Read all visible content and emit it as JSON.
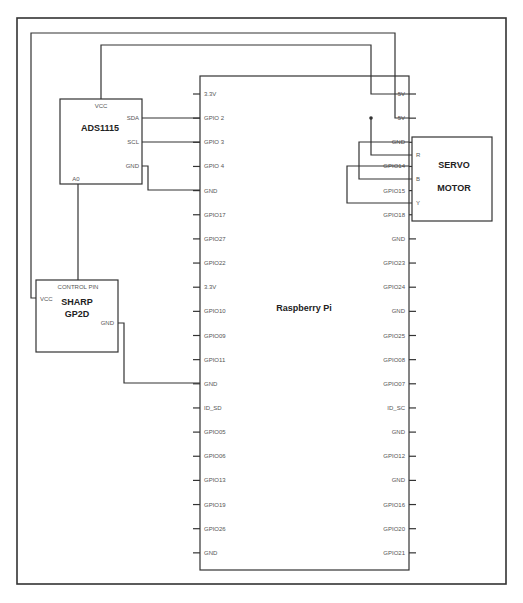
{
  "diagram": {
    "type": "wiring-schematic",
    "components": {
      "ads1115": {
        "title": "ADS1115",
        "pins": {
          "vcc": "VCC",
          "sda": "SDA",
          "scl": "SCL",
          "gnd": "GND",
          "a0": "A0"
        }
      },
      "sharp": {
        "title_line1": "SHARP",
        "title_line2": "GP2D",
        "pins": {
          "control": "CONTROL PIN",
          "vcc": "VCC",
          "gnd": "GND"
        }
      },
      "rpi": {
        "title": "Raspberry Pi",
        "left_pins": [
          "3.3V",
          "GPIO 2",
          "GPIO 3",
          "GPIO 4",
          "GND",
          "GPIO17",
          "GPIO27",
          "GPIO22",
          "3.3V",
          "GPIO10",
          "GPIO09",
          "GPIO11",
          "GND",
          "ID_SD",
          "GPIO05",
          "GPIO06",
          "GPIO13",
          "GPIO19",
          "GPIO26",
          "GND"
        ],
        "right_pins": [
          "5V",
          "5V",
          "GND",
          "GPIO14",
          "GPIO15",
          "GPIO18",
          "GND",
          "GPIO23",
          "GPIO24",
          "GND",
          "GPIO25",
          "GPIO08",
          "GPIO07",
          "ID_SC",
          "GND",
          "GPIO12",
          "GND",
          "GPIO16",
          "GPIO20",
          "GPIO21"
        ]
      },
      "servo": {
        "title_line1": "SERVO",
        "title_line2": "MOTOR",
        "pins": {
          "r": "R",
          "b": "B",
          "y": "Y"
        }
      }
    },
    "connections": [
      {
        "from": "ADS1115.VCC",
        "to": "RPi.5V(1)"
      },
      {
        "from": "ADS1115.SDA",
        "to": "RPi.GPIO 2"
      },
      {
        "from": "ADS1115.SCL",
        "to": "RPi.GPIO 3"
      },
      {
        "from": "ADS1115.GND",
        "to": "RPi.GND"
      },
      {
        "from": "ADS1115.A0",
        "to": "SHARP.CONTROL PIN"
      },
      {
        "from": "SHARP.VCC",
        "to": "RPi.5V(2)"
      },
      {
        "from": "SHARP.GND",
        "to": "RPi.GND"
      },
      {
        "from": "RPi.5V(2)",
        "to": "SERVO.R"
      },
      {
        "from": "RPi.GND",
        "to": "SERVO.B"
      },
      {
        "from": "RPi.GPIO14",
        "to": "SERVO.Y"
      }
    ],
    "colors": {
      "line": "#333333",
      "label": "#555555",
      "title": "#222222",
      "background": "#ffffff"
    }
  }
}
